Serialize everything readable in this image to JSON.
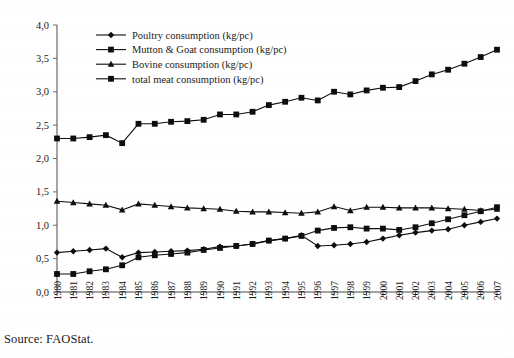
{
  "source_note": "Source: FAOStat.",
  "chart_data": {
    "type": "line",
    "title": "",
    "subtitle": "",
    "xlabel": "",
    "ylabel": "",
    "grid": false,
    "legend_position": "top-left-inside",
    "decimal_separator": ",",
    "ylim": [
      0.0,
      4.0
    ],
    "ytick_step": 0.5,
    "ytick_labels": [
      "0,0",
      "0,5",
      "1,0",
      "1,5",
      "2,0",
      "2,5",
      "3,0",
      "3,5",
      "4,0"
    ],
    "ytick_values": [
      0.0,
      0.5,
      1.0,
      1.5,
      2.0,
      2.5,
      3.0,
      3.5,
      4.0
    ],
    "categories": [
      "1980",
      "1981",
      "1982",
      "1983",
      "1984",
      "1985",
      "1986",
      "1987",
      "1988",
      "1989",
      "1990",
      "1991",
      "1992",
      "1993",
      "1994",
      "1995",
      "1996",
      "1997",
      "1998",
      "1999",
      "2000",
      "2001",
      "2002",
      "2003",
      "2004",
      "2005",
      "2006",
      "2007"
    ],
    "x": [
      1980,
      1981,
      1982,
      1983,
      1984,
      1985,
      1986,
      1987,
      1988,
      1989,
      1990,
      1991,
      1992,
      1993,
      1994,
      1995,
      1996,
      1997,
      1998,
      1999,
      2000,
      2001,
      2002,
      2003,
      2004,
      2005,
      2006,
      2007
    ],
    "series": [
      {
        "name": "Poultry consumption (kg/pc)",
        "marker": "diamond",
        "color": "#0d0d0d",
        "values": [
          0.59,
          0.61,
          0.63,
          0.65,
          0.52,
          0.59,
          0.6,
          0.61,
          0.62,
          0.64,
          0.68,
          0.69,
          0.72,
          0.77,
          0.8,
          0.85,
          0.69,
          0.7,
          0.72,
          0.75,
          0.8,
          0.85,
          0.89,
          0.92,
          0.94,
          1.0,
          1.05,
          1.1
        ]
      },
      {
        "name": "Mutton & Goat consumption (kg/pc)",
        "marker": "square",
        "color": "#0d0d0d",
        "values": [
          0.27,
          0.27,
          0.31,
          0.34,
          0.4,
          0.52,
          0.55,
          0.57,
          0.59,
          0.63,
          0.66,
          0.69,
          0.72,
          0.77,
          0.8,
          0.84,
          0.92,
          0.96,
          0.97,
          0.95,
          0.95,
          0.93,
          0.97,
          1.03,
          1.09,
          1.15,
          1.21,
          1.27
        ]
      },
      {
        "name": "Bovine consumption (kg/pc)",
        "marker": "triangle",
        "color": "#0d0d0d",
        "values": [
          1.36,
          1.34,
          1.32,
          1.3,
          1.23,
          1.32,
          1.3,
          1.28,
          1.26,
          1.25,
          1.24,
          1.21,
          1.2,
          1.2,
          1.19,
          1.18,
          1.2,
          1.28,
          1.22,
          1.27,
          1.27,
          1.26,
          1.26,
          1.26,
          1.25,
          1.24,
          1.22,
          1.24
        ]
      },
      {
        "name": "total meat consumption (kg/pc)",
        "marker": "square",
        "color": "#0d0d0d",
        "values": [
          2.3,
          2.3,
          2.32,
          2.35,
          2.23,
          2.52,
          2.52,
          2.55,
          2.56,
          2.58,
          2.66,
          2.66,
          2.7,
          2.8,
          2.85,
          2.91,
          2.87,
          3.0,
          2.96,
          3.02,
          3.06,
          3.07,
          3.16,
          3.26,
          3.33,
          3.42,
          3.52,
          3.63
        ]
      }
    ]
  }
}
